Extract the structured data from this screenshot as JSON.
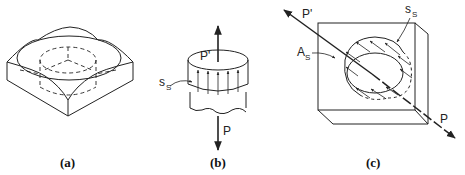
{
  "figure": {
    "panels": [
      {
        "id": "a",
        "caption": "(a)",
        "description": "Isometric square block with circular countersunk top and dashed hidden cylindrical hole"
      },
      {
        "id": "b",
        "caption": "(b)",
        "description": "Cylindrical section with upward shear stress arrows on its side surface",
        "labels": {
          "force_top": "P'",
          "stress_main": "s",
          "stress_sub": "S",
          "force_bottom": "P"
        }
      },
      {
        "id": "c",
        "caption": "(c)",
        "description": "Block with circular hole cut, diagonal force line and shear stress arrows",
        "labels": {
          "force_top": "P'",
          "stress_main": "s",
          "stress_sub": "S",
          "area_main": "A",
          "area_sub": "S",
          "force_bottom": "P"
        }
      }
    ]
  },
  "colors": {
    "line": "#222222",
    "background": "#ffffff"
  }
}
